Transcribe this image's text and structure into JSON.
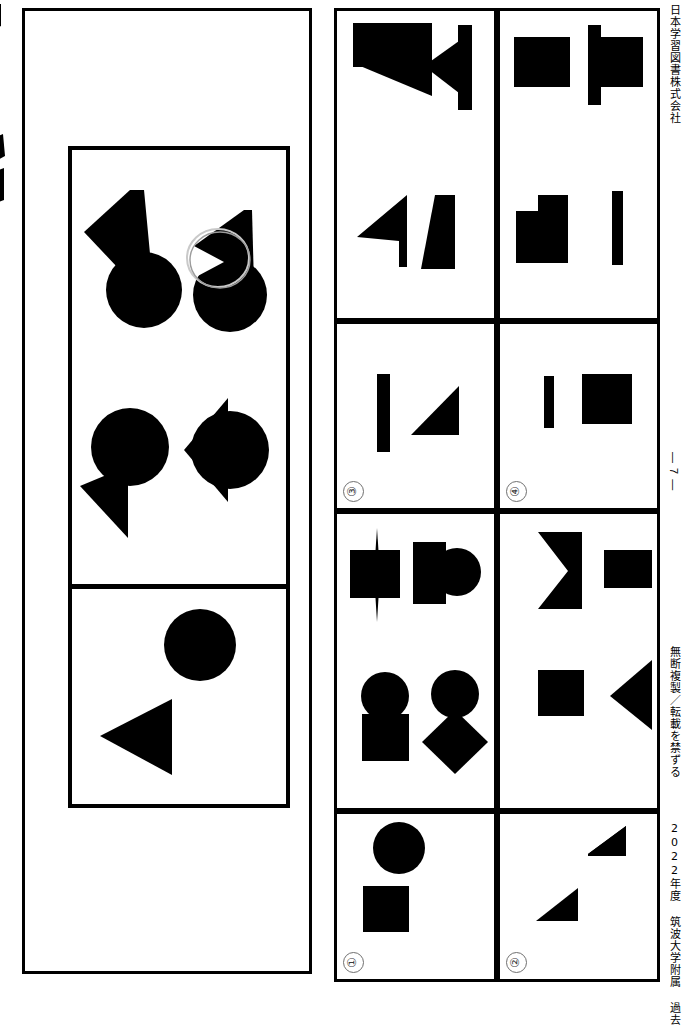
{
  "page": {
    "width": 684,
    "height": 982,
    "page_number": "— 7 —",
    "ink_color": "#000000",
    "paper_color": "#ffffff"
  },
  "side_texts": {
    "publisher": "日本学習図書株式会社",
    "copyright": "無断複製／転載を禁ずる",
    "exam_info": "2022年度 筑波大学附属 過去"
  },
  "sample_panel": {
    "name": "sample-problem-box",
    "top_section_label": "",
    "bottom_section_label": "",
    "top_figures": [
      {
        "id": "fig-1",
        "description": "wedge-quadrilateral joined to circle",
        "selected": false
      },
      {
        "id": "fig-2",
        "description": "arrow-wedge joined to circle",
        "selected": true
      },
      {
        "id": "fig-3",
        "description": "circle with triangle at lower-left",
        "selected": false
      },
      {
        "id": "fig-4",
        "description": "circle with left-pointing arrow notch",
        "selected": false
      }
    ],
    "bottom_figures": [
      {
        "id": "fig-5",
        "description": "circle",
        "selected": false
      },
      {
        "id": "fig-6",
        "description": "left-pointing triangle",
        "selected": false
      }
    ],
    "answer_mark": {
      "type": "hand-drawn-circle",
      "on_figure": "fig-2"
    }
  },
  "options": [
    {
      "number": "③",
      "position": "row3-left",
      "shapes": [
        "vertical bar",
        "right triangle"
      ]
    },
    {
      "number": "④",
      "position": "row3-right",
      "shapes": [
        "vertical bar",
        "square"
      ]
    },
    {
      "number": "①",
      "position": "row5-left",
      "shapes": [
        "circle",
        "square"
      ]
    },
    {
      "number": "②",
      "position": "row5-right",
      "shapes": [
        "right triangle",
        "right triangle"
      ]
    }
  ],
  "unnumbered_cells": [
    {
      "position": "row1-left",
      "shapes": [
        "pentagon wedge",
        "left-pointing arrow with bar"
      ]
    },
    {
      "position": "row1-right",
      "shapes": [
        "square",
        "flag / plus-bar rectangle"
      ]
    },
    {
      "position": "row2-left",
      "shapes": [
        "triangle with leg",
        "slanted parallelogram"
      ]
    },
    {
      "position": "row2-right",
      "shapes": [
        "L-shaped block",
        "vertical bar"
      ]
    },
    {
      "position": "row4-left",
      "shapes": [
        "square with vertical spike",
        "rectangle with circle"
      ]
    },
    {
      "position": "row4-right",
      "shapes": [
        "chevron / arrowhead",
        "rectangle"
      ]
    },
    {
      "position": "row4b-left",
      "shapes": [
        "circle over square",
        "circle over diamond"
      ]
    },
    {
      "position": "row4b-right",
      "shapes": [
        "square",
        "left-pointing triangle"
      ]
    }
  ]
}
